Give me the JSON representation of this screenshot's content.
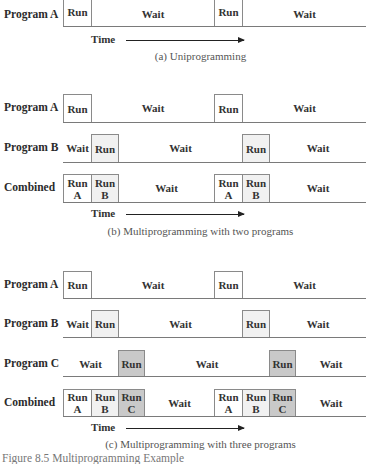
{
  "labels": {
    "program_a": "Program A",
    "program_b": "Program B",
    "program_c": "Program C",
    "combined": "Combined",
    "run": "Run",
    "wait": "Wait",
    "time": "Time"
  },
  "combined_cells": {
    "run_a": "Run\nA",
    "run_b": "Run\nB",
    "run_c": "Run\nC",
    "a": "A",
    "b": "B",
    "c": "C"
  },
  "captions": {
    "a": "(a) Uniprogramming",
    "b": "(b) Multiprogramming with two programs",
    "c": "(c) Multiprogramming with three programs",
    "figure": "Figure 8.5   Multiprogramming Example"
  },
  "colors": {
    "program_a_fill": "#ffffff",
    "program_b_fill": "#f1f1f1",
    "program_c_fill": "#c9c9c9",
    "line": "#7a7a7a"
  },
  "sections": [
    {
      "id": "uniprogramming",
      "rows": [
        {
          "label": "Program A",
          "segments": [
            "Run",
            "Wait",
            "Run",
            "Wait"
          ]
        }
      ]
    },
    {
      "id": "multiprogramming-two",
      "rows": [
        {
          "label": "Program A",
          "segments": [
            "Run",
            "Wait",
            "Run",
            "Wait"
          ]
        },
        {
          "label": "Program B",
          "segments": [
            "Wait",
            "Run",
            "Wait",
            "Run",
            "Wait"
          ]
        },
        {
          "label": "Combined",
          "segments": [
            "Run A",
            "Run B",
            "Wait",
            "Run A",
            "Run B",
            "Wait"
          ]
        }
      ]
    },
    {
      "id": "multiprogramming-three",
      "rows": [
        {
          "label": "Program A",
          "segments": [
            "Run",
            "Wait",
            "Run",
            "Wait"
          ]
        },
        {
          "label": "Program B",
          "segments": [
            "Wait",
            "Run",
            "Wait",
            "Run",
            "Wait"
          ]
        },
        {
          "label": "Program C",
          "segments": [
            "Wait",
            "Run",
            "Wait",
            "Run",
            "Wait"
          ]
        },
        {
          "label": "Combined",
          "segments": [
            "Run A",
            "Run B",
            "Run C",
            "Wait",
            "Run A",
            "Run B",
            "Run C",
            "Wait"
          ]
        }
      ]
    }
  ]
}
